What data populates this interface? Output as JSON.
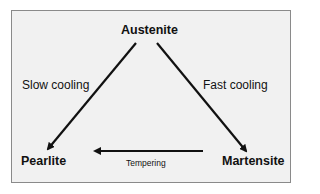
{
  "diagram": {
    "nodes": {
      "top": "Austenite",
      "left": "Pearlite",
      "right": "Martensite"
    },
    "edges": {
      "top_left": "Slow cooling",
      "top_right": "Fast cooling",
      "right_left": "Tempering"
    },
    "colors": {
      "background": "#f1f1f1",
      "border": "#8a8a8a",
      "ink": "#111111"
    }
  }
}
